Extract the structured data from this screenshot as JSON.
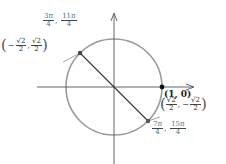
{
  "diagram": {
    "type": "unit-circle",
    "colors": {
      "circle": "#999999",
      "axes": "#555555",
      "chord": "#333333",
      "angle_labels": "#3e7c8a",
      "point": "#333333"
    },
    "circle": {
      "cx": 114,
      "cy": 87,
      "r": 48
    },
    "axes": {
      "x_arrow": "right",
      "y_arrow": "up"
    },
    "points": [
      {
        "name": "point-3pi-4",
        "angle_labels": [
          {
            "num": "3π",
            "den": "4"
          },
          {
            "num": "11π",
            "den": "4"
          }
        ],
        "coordinates": {
          "x": {
            "sign": "−",
            "num": "√2",
            "den": "2"
          },
          "y": {
            "sign": "",
            "num": "√2",
            "den": "2"
          }
        }
      },
      {
        "name": "point-1-0",
        "label": "(1, 0)"
      },
      {
        "name": "point-7pi-4",
        "angle_labels": [
          {
            "num": "7π",
            "den": "4"
          },
          {
            "num": "15π",
            "den": "4"
          }
        ],
        "coordinates": {
          "x": {
            "sign": "",
            "num": "√2",
            "den": "2"
          },
          "y": {
            "sign": "−",
            "num": "√2",
            "den": "2"
          }
        }
      }
    ],
    "separator": ",",
    "open_paren": "(",
    "close_paren": ")"
  }
}
